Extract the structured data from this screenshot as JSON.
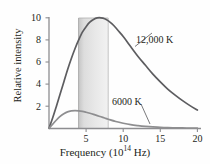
{
  "chart_data": {
    "type": "line",
    "title": "",
    "xlabel_prefix": "Frequency (10",
    "xlabel_exponent": "14",
    "xlabel_suffix": " Hz)",
    "xlabel": "Frequency (10^14 Hz)",
    "ylabel": "Relative intensity",
    "xlim": [
      0,
      20.5
    ],
    "ylim": [
      0,
      10.8
    ],
    "xticks": [
      "5",
      "10",
      "15",
      "20"
    ],
    "xtick_values": [
      5,
      10,
      15,
      20
    ],
    "yticks": [
      "2",
      "4",
      "6",
      "8",
      "10"
    ],
    "ytick_values": [
      2,
      4,
      6,
      8,
      10
    ],
    "grid": false,
    "legend_position": "inline-annotations",
    "curve_color": "#5d5d60",
    "axis_color": "#8a8a8d",
    "band_color_left": "#c9c9c9",
    "band_color_right": "#eeeeee",
    "series": [
      {
        "name": "12,000 K",
        "label": "12,000 K",
        "peak_x": 7.0,
        "peak_y": 10.0,
        "x": [
          0,
          0.5,
          1,
          1.5,
          2,
          2.5,
          3,
          3.5,
          4,
          4.5,
          5,
          5.5,
          6,
          6.5,
          7,
          7.5,
          8,
          8.5,
          9,
          9.5,
          10,
          11,
          12,
          13,
          14,
          15,
          16,
          17,
          18,
          19,
          20
        ],
        "values": [
          0,
          0.95,
          2.0,
          3.1,
          4.2,
          5.3,
          6.3,
          7.2,
          8.0,
          8.7,
          9.2,
          9.6,
          9.85,
          9.99,
          10.0,
          9.92,
          9.72,
          9.45,
          9.1,
          8.7,
          8.3,
          7.4,
          6.5,
          5.7,
          4.9,
          4.2,
          3.55,
          3.0,
          2.5,
          2.05,
          1.65
        ]
      },
      {
        "name": "6000 K",
        "label": "6000 K",
        "peak_x": 3.6,
        "peak_y": 1.6,
        "x": [
          0,
          0.5,
          1,
          1.5,
          2,
          2.5,
          3,
          3.5,
          4,
          4.5,
          5,
          5.5,
          6,
          6.5,
          7,
          7.5,
          8,
          9,
          10,
          11,
          12,
          13,
          14,
          15,
          16,
          17,
          18,
          19,
          20
        ],
        "values": [
          0,
          0.38,
          0.75,
          1.08,
          1.32,
          1.49,
          1.57,
          1.6,
          1.58,
          1.53,
          1.45,
          1.36,
          1.26,
          1.15,
          1.04,
          0.93,
          0.82,
          0.62,
          0.46,
          0.33,
          0.24,
          0.17,
          0.12,
          0.09,
          0.06,
          0.045,
          0.03,
          0.02,
          0.015
        ]
      }
    ],
    "shaded_band": {
      "name": "visible-spectrum-band",
      "x_start": 4.0,
      "x_end": 8.0,
      "y_top": 10.6
    },
    "annotations": [
      {
        "text": "12,000 K",
        "target_series": "12,000 K"
      },
      {
        "text": "6000 K",
        "target_series": "6000 K"
      }
    ]
  }
}
